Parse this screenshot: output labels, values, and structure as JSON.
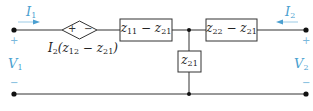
{
  "diagram": {
    "type": "two-port-equivalent-circuit",
    "colors": {
      "wire": "#333333",
      "annotation": "#4a9fd0",
      "sign": "#7ab8dc",
      "background": "#ffffff"
    },
    "port1": {
      "current_label": "I",
      "current_sub": "1",
      "current_direction": "right",
      "voltage_label": "V",
      "voltage_sub": "1",
      "plus": "+",
      "minus": "−"
    },
    "port2": {
      "current_label": "I",
      "current_sub": "2",
      "current_direction": "left",
      "voltage_label": "V",
      "voltage_sub": "2",
      "plus": "+",
      "minus": "−"
    },
    "dependent_source": {
      "plus": "+",
      "minus": "−",
      "label_prefix": "I",
      "label_prefix_sub": "2",
      "label_open": "(z",
      "label_sub_a": "12",
      "label_mid": " − z",
      "label_sub_b": "21",
      "label_close": ")"
    },
    "impedances": [
      {
        "id": "series-left",
        "var": "z",
        "sub1": "11",
        "op": " − ",
        "var2": "z",
        "sub2": "21"
      },
      {
        "id": "series-right",
        "var": "z",
        "sub1": "22",
        "op": " − ",
        "var2": "z",
        "sub2": "21"
      },
      {
        "id": "shunt",
        "var": "z",
        "sub1": "21"
      }
    ]
  }
}
